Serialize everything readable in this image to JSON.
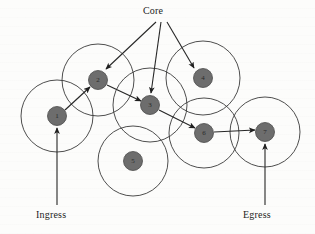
{
  "figure": {
    "title": "Core",
    "width": 315,
    "height": 234,
    "background_color": "#fcfcfb",
    "node_fill_color": "#6d6d6d",
    "stroke_color": "#262626",
    "range_circle_color": "#3a3a3a"
  },
  "labels": {
    "core": "Core",
    "ingress": "Ingress",
    "egress": "Egress"
  },
  "nodes": [
    {
      "id": "node-1",
      "label": "1",
      "cx": 57,
      "cy": 116,
      "r": 9.5,
      "range_r": 36
    },
    {
      "id": "node-2",
      "label": "2",
      "cx": 98,
      "cy": 80,
      "r": 9.5,
      "range_r": 36
    },
    {
      "id": "node-3",
      "label": "3",
      "cx": 150,
      "cy": 105,
      "r": 9.5,
      "range_r": 37
    },
    {
      "id": "node-4",
      "label": "4",
      "cx": 203,
      "cy": 78,
      "r": 9.5,
      "range_r": 37
    },
    {
      "id": "node-5",
      "label": "5",
      "cx": 133,
      "cy": 161,
      "r": 9.5,
      "range_r": 35
    },
    {
      "id": "node-6",
      "label": "6",
      "cx": 204,
      "cy": 133,
      "r": 9.5,
      "range_r": 35
    },
    {
      "id": "node-7",
      "label": "7",
      "cx": 265,
      "cy": 132,
      "r": 9.5,
      "range_r": 35
    }
  ],
  "path_links": [
    {
      "id": "link-1-2",
      "from": "node-1",
      "to": "node-2",
      "x1": 65,
      "y1": 110,
      "x2": 90,
      "y2": 87
    },
    {
      "id": "link-2-3",
      "from": "node-2",
      "to": "node-3",
      "x1": 107,
      "y1": 85,
      "x2": 141,
      "y2": 101
    },
    {
      "id": "link-3-6",
      "from": "node-3",
      "to": "node-6",
      "x1": 159,
      "y1": 110,
      "x2": 195,
      "y2": 128
    },
    {
      "id": "link-6-7",
      "from": "node-6",
      "to": "node-7",
      "x1": 214,
      "y1": 132,
      "x2": 255,
      "y2": 130
    }
  ],
  "core_arrows": [
    {
      "id": "core-to-node-2",
      "to": "node-2",
      "x1": 156,
      "y1": 22,
      "x2": 106,
      "y2": 69
    },
    {
      "id": "core-to-node-3",
      "to": "node-3",
      "x1": 161,
      "y1": 22,
      "x2": 151,
      "y2": 93
    },
    {
      "id": "core-to-node-4",
      "to": "node-4",
      "x1": 167,
      "y1": 22,
      "x2": 194,
      "y2": 68
    }
  ],
  "io_arrows": [
    {
      "id": "ingress-arrow",
      "target": "node-1",
      "x1": 57,
      "y1": 205,
      "x2": 57,
      "y2": 128
    },
    {
      "id": "egress-arrow",
      "target": "node-7",
      "x1": 265,
      "y1": 205,
      "x2": 265,
      "y2": 144
    }
  ]
}
